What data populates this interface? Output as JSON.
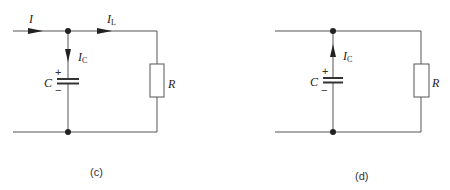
{
  "figure": {
    "panels": [
      {
        "id": "c",
        "caption": "(c)",
        "labels": {
          "current_in": "I",
          "current_load": "I",
          "current_load_sub": "L",
          "current_cap": "I",
          "current_cap_sub": "C",
          "capacitor": "C",
          "plus": "+",
          "minus": "−",
          "resistor": "R"
        },
        "cap_current_direction": "down"
      },
      {
        "id": "d",
        "caption": "(d)",
        "labels": {
          "current_cap": "I",
          "current_cap_sub": "C",
          "capacitor": "C",
          "plus": "+",
          "minus": "−",
          "resistor": "R"
        },
        "cap_current_direction": "up"
      }
    ]
  }
}
